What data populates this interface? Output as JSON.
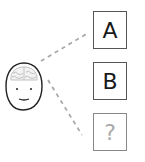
{
  "diagram": {
    "options": [
      {
        "label": "A",
        "state": "known"
      },
      {
        "label": "B",
        "state": "known"
      },
      {
        "label": "?",
        "state": "unknown"
      }
    ],
    "colors": {
      "outline": "#555555",
      "text": "#1a1a1a",
      "faded": "#aaaaaa",
      "dashed_line": "#aaaaaa",
      "brain": "#bbbbbb"
    }
  }
}
